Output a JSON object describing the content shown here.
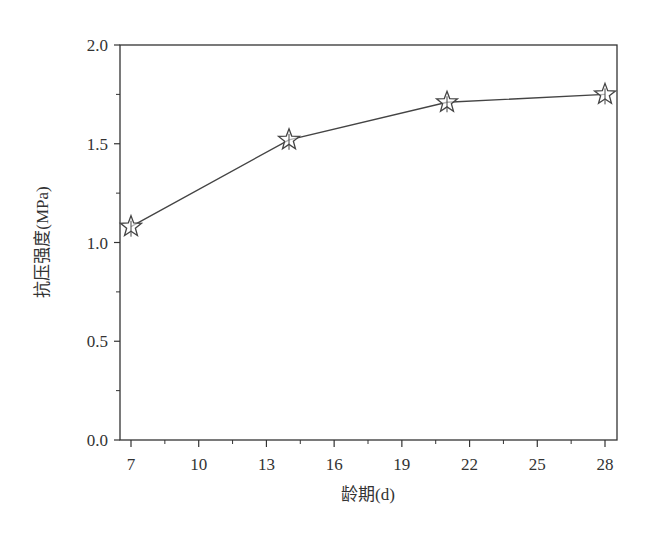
{
  "chart_data": {
    "type": "line",
    "title": "",
    "xlabel": "龄期(d)",
    "ylabel": "抗压强度(MPa)",
    "x": [
      7,
      14,
      21,
      28
    ],
    "series": [
      {
        "name": "抗压强度",
        "values": [
          1.08,
          1.52,
          1.71,
          1.75
        ],
        "marker": "star-open",
        "color": "#444444"
      }
    ],
    "xlim": [
      6.5,
      28.5
    ],
    "ylim": [
      0.0,
      2.0
    ],
    "xticks": [
      7,
      10,
      13,
      16,
      19,
      22,
      25,
      28
    ],
    "xtick_labels": [
      "7",
      "10",
      "13",
      "16",
      "19",
      "22",
      "25",
      "28"
    ],
    "yticks": [
      0.0,
      0.5,
      1.0,
      1.5,
      2.0
    ],
    "ytick_labels": [
      "0.0",
      "0.5",
      "1.0",
      "1.5",
      "2.0"
    ],
    "grid": false,
    "legend": null
  },
  "axes": {
    "x_title": "龄期(d)",
    "y_title": "抗压强度(MPa)"
  },
  "colors": {
    "line": "#444444",
    "axis": "#333333",
    "background": "#ffffff"
  }
}
